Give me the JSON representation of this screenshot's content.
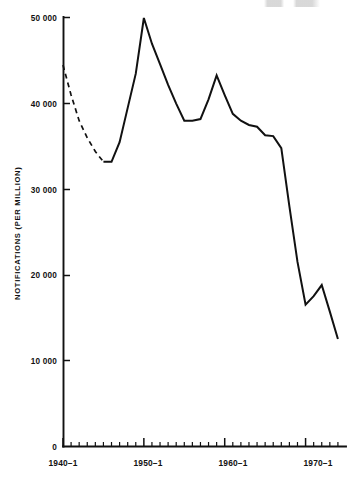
{
  "chart_data": {
    "type": "line",
    "title": "",
    "subtitle": "",
    "xlabel": "",
    "ylabel": "NOTIFICATIONS (PER MILLION)",
    "xlim": [
      1940,
      1975
    ],
    "ylim": [
      0,
      50000
    ],
    "grid": false,
    "legend": null,
    "y_ticks": [
      {
        "value": 0,
        "label": "0"
      },
      {
        "value": 10000,
        "label": "10 000"
      },
      {
        "value": 20000,
        "label": "20 000"
      },
      {
        "value": 30000,
        "label": "30 000"
      },
      {
        "value": 40000,
        "label": "40 000"
      },
      {
        "value": 50000,
        "label": "50 000"
      }
    ],
    "x_ticks_major": [
      {
        "value": 1940,
        "label": "1940–1"
      },
      {
        "value": 1950,
        "label": "1950–1"
      },
      {
        "value": 1960,
        "label": "1960–1"
      },
      {
        "value": 1970,
        "label": "1970–1"
      }
    ],
    "x_ticks_minor": [
      1941,
      1942,
      1943,
      1944,
      1945,
      1946,
      1947,
      1948,
      1949,
      1951,
      1952,
      1953,
      1954,
      1955,
      1956,
      1957,
      1958,
      1959,
      1961,
      1962,
      1963,
      1964,
      1965,
      1966,
      1967,
      1968,
      1969,
      1971,
      1972,
      1973,
      1974
    ],
    "series": [
      {
        "name": "notifications-estimated",
        "style": "dashed",
        "x": [
          1940,
          1941,
          1942,
          1943,
          1944,
          1945
        ],
        "values": [
          44500,
          41000,
          38000,
          36000,
          34400,
          33200
        ]
      },
      {
        "name": "notifications-recorded",
        "style": "solid",
        "x": [
          1945,
          1946,
          1947,
          1948,
          1949,
          1950,
          1951,
          1952,
          1953,
          1954,
          1955,
          1956,
          1957,
          1958,
          1959,
          1960,
          1961,
          1962,
          1963,
          1964,
          1965,
          1966,
          1967,
          1968,
          1969,
          1970,
          1971,
          1972,
          1973,
          1974
        ],
        "values": [
          33200,
          33200,
          35500,
          39500,
          43500,
          50000,
          47000,
          44600,
          42200,
          40000,
          38000,
          38000,
          38200,
          40500,
          43300,
          41000,
          38800,
          38000,
          37500,
          37300,
          36300,
          36200,
          34800,
          28000,
          21500,
          16500,
          17500,
          18800,
          15700,
          12500
        ]
      }
    ],
    "annotations": []
  },
  "figure": {
    "plot_area": {
      "left_px": 63,
      "top_px": 18,
      "right_px": 346,
      "bottom_px": 446
    },
    "background_color": "#ffffff",
    "line_color": "#111111",
    "axis_color": "#111111"
  }
}
